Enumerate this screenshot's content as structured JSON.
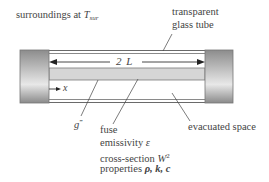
{
  "labels": {
    "surroundings": "surroundings at ",
    "surroundings_symbol": "T",
    "surroundings_subscript": "sur",
    "glass_tube_line1": "transparent",
    "glass_tube_line2": "glass tube",
    "length": "2 L",
    "x_axis": "x",
    "generation": "g",
    "generation_sup": "‴",
    "fuse_title": "fuse",
    "fuse_emissivity": "emissivity ",
    "fuse_emissivity_symbol": "ε",
    "fuse_cross_section": "cross-section ",
    "fuse_cross_section_symbol": "W",
    "fuse_cross_section_sup": "2",
    "fuse_properties": "properties ",
    "fuse_properties_symbols": "ρ, k, c",
    "evacuated": "evacuated space"
  },
  "colors": {
    "tube_line": "#6a6a6a",
    "fuse_fill": "#d6d6d6",
    "cap_dark": "#8a8a8a",
    "cap_light": "#e6e6e6",
    "text": "#444444"
  }
}
